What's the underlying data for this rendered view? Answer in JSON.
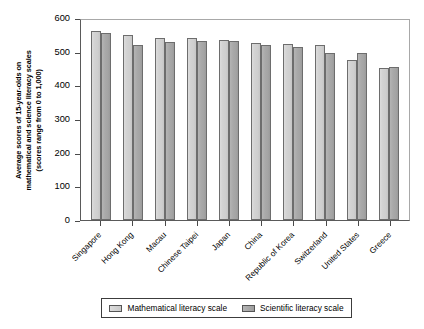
{
  "chart_data": {
    "type": "bar",
    "title": "",
    "xlabel": "",
    "ylabel": "Average scores of 15-year-olds on mathematical and science literacy scales (scores range from 0 to 1,000)",
    "ylabel_lines": [
      "Average scores of 15-year-olds on",
      "mathematical and science literacy scales",
      "(scores range from 0 to 1,000)"
    ],
    "ylim": [
      0,
      600
    ],
    "yticks": [
      600,
      500,
      400,
      300,
      200,
      100,
      0
    ],
    "ytick_labels": [
      "600",
      "500",
      "400",
      "300",
      "200",
      "100",
      "0"
    ],
    "grid": false,
    "legend_position": "bottom",
    "categories": [
      "Singapore",
      "Hong Kong",
      "Macau",
      "Chinese Taipei",
      "Japan",
      "China",
      "Republic of Korea",
      "Switzerland",
      "United States",
      "Greece"
    ],
    "series": [
      {
        "name": "Mathematical  literacy scale",
        "color": "#d2d2d2",
        "values": [
          562,
          550,
          541,
          540,
          534,
          525,
          524,
          520,
          474,
          452
        ]
      },
      {
        "name": "Scientific literacy scale",
        "color": "#a6a6a6",
        "values": [
          556,
          521,
          529,
          533,
          531,
          520,
          514,
          496,
          497,
          454
        ]
      }
    ]
  },
  "legend": {
    "items": [
      {
        "label": "Mathematical  literacy scale",
        "swatch": "math"
      },
      {
        "label": "Scientific literacy scale",
        "swatch": "sci"
      }
    ]
  }
}
